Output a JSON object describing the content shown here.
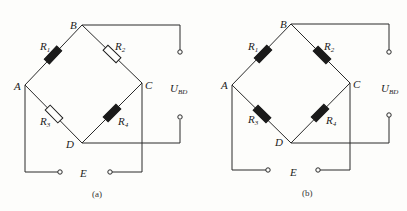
{
  "diagrams": [
    {
      "caption": "(a)",
      "nodes": {
        "A": "A",
        "B": "B",
        "C": "C",
        "D": "D",
        "E": "E"
      },
      "resistors": [
        {
          "label": "R",
          "sub": "1",
          "filled": true
        },
        {
          "label": "R",
          "sub": "2",
          "filled": false
        },
        {
          "label": "R",
          "sub": "3",
          "filled": false
        },
        {
          "label": "R",
          "sub": "4",
          "filled": true
        }
      ],
      "output": {
        "label": "U",
        "sub": "BD"
      }
    },
    {
      "caption": "(b)",
      "nodes": {
        "A": "A",
        "B": "B",
        "C": "C",
        "D": "D",
        "E": "E"
      },
      "resistors": [
        {
          "label": "R",
          "sub": "1",
          "filled": true
        },
        {
          "label": "R",
          "sub": "2",
          "filled": true
        },
        {
          "label": "R",
          "sub": "3",
          "filled": true
        },
        {
          "label": "R",
          "sub": "4",
          "filled": true
        }
      ],
      "output": {
        "label": "U",
        "sub": "BD"
      }
    }
  ],
  "colors": {
    "line": "#2a2a2a",
    "background": "#fdfdfb"
  }
}
